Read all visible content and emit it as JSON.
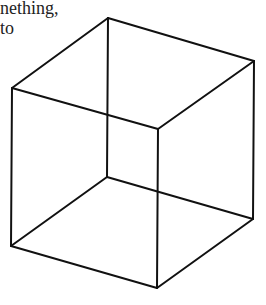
{
  "caption": {
    "line1": "nething,",
    "line2": "to"
  },
  "figure": {
    "type": "wireframe-cube",
    "stroke": "#111111",
    "vertices": {
      "top_back": [
        108,
        18
      ],
      "top_right": [
        254,
        61
      ],
      "top_left": [
        12,
        88
      ],
      "top_front": [
        158,
        129
      ],
      "bottom_back": [
        107,
        177
      ],
      "bottom_left": [
        11,
        246
      ],
      "bottom_right": [
        253,
        219
      ],
      "bottom_front": [
        157,
        288
      ]
    }
  }
}
